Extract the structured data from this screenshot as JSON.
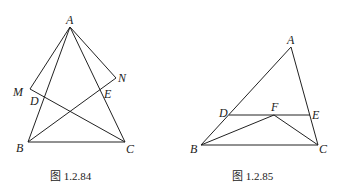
{
  "figures": [
    {
      "caption": "图 1.2.84",
      "points": {
        "A": "A",
        "M": "M",
        "N": "N",
        "D": "D",
        "E": "E",
        "B": "B",
        "C": "C"
      }
    },
    {
      "caption": "图 1.2.85",
      "points": {
        "A": "A",
        "D": "D",
        "F": "F",
        "E": "E",
        "B": "B",
        "C": "C"
      }
    }
  ]
}
